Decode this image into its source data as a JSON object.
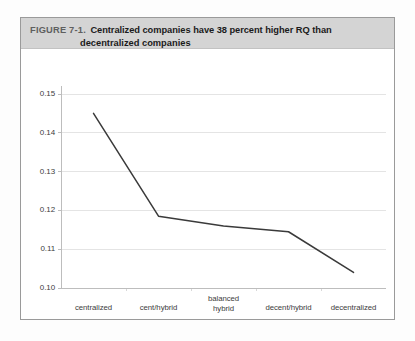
{
  "figure": {
    "label": "FIGURE 7-1.",
    "title_line1": "Centralized companies have 38 percent higher RQ than",
    "title_line2": "decentralized companies",
    "band_color": "#d4d4d4",
    "border_color": "#9a9a9a"
  },
  "chart_data": {
    "type": "line",
    "title": "Centralized companies have 38 percent higher RQ than decentralized companies",
    "xlabel": "",
    "ylabel": "",
    "categories": [
      "centralized",
      "cent/hybrid",
      "balanced hybrid",
      "decent/hybrid",
      "decentralized"
    ],
    "category_lines": [
      [
        "centralized"
      ],
      [
        "cent/hybrid"
      ],
      [
        "balanced",
        "hybrid"
      ],
      [
        "decent/hybrid"
      ],
      [
        "decentralized"
      ]
    ],
    "values": [
      0.145,
      0.1185,
      0.116,
      0.1145,
      0.104
    ],
    "ylim": [
      0.1,
      0.15
    ],
    "yticks": [
      0.1,
      0.11,
      0.12,
      0.13,
      0.14,
      0.15
    ],
    "ytick_labels": [
      "0.10",
      "0.11",
      "0.12",
      "0.13",
      "0.14",
      "0.15"
    ],
    "grid": true,
    "legend": false,
    "line_color": "#3a3a3a",
    "grid_color": "#e4e4e4",
    "axis_color": "#bdbdbd"
  }
}
